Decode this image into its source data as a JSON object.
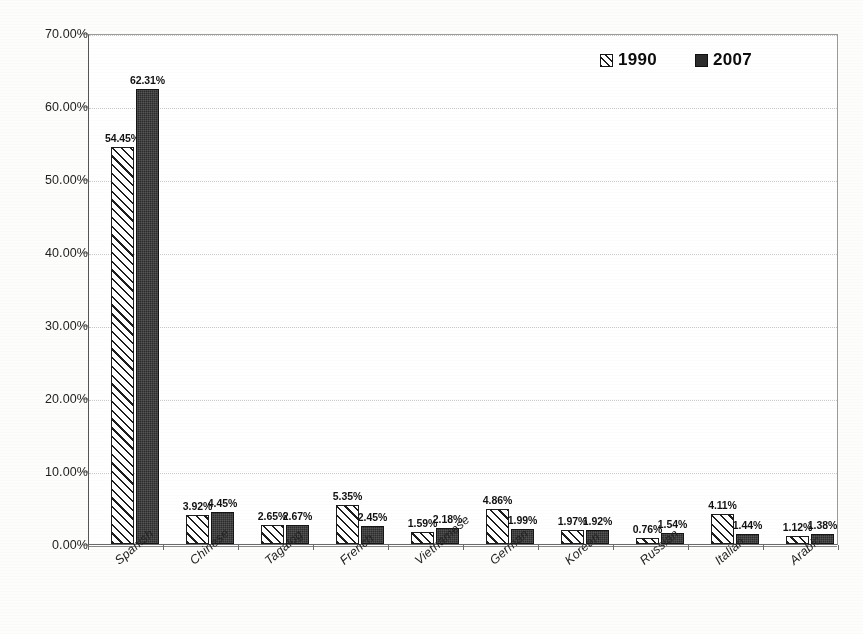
{
  "chart_data": {
    "type": "bar",
    "title": "",
    "subtitle": "",
    "xlabel": "",
    "ylabel": "",
    "ylim": [
      0,
      70
    ],
    "ytick_step": 10,
    "ytick_labels": [
      "0.00%",
      "10.00%",
      "20.00%",
      "30.00%",
      "40.00%",
      "50.00%",
      "60.00%",
      "70.00%"
    ],
    "ytick_values": [
      0,
      10,
      20,
      30,
      40,
      50,
      60,
      70
    ],
    "grid": true,
    "grid_axis": "y",
    "legend_position": "top-right",
    "value_suffix": "%",
    "categories": [
      "Spanish",
      "Chinese",
      "Tagalog",
      "French",
      "Vietnamese",
      "German",
      "Korean",
      "Russian",
      "Italian",
      "Arabic"
    ],
    "series": [
      {
        "name": "1990",
        "values": [
          54.45,
          3.92,
          2.65,
          5.35,
          1.59,
          4.86,
          1.97,
          0.76,
          4.11,
          1.12
        ],
        "labels": [
          "54.45%",
          "3.92%",
          "2.65%",
          "5.35%",
          "1.59%",
          "4.86%",
          "1.97%",
          "0.76%",
          "4.11%",
          "1.12%"
        ],
        "fill": "hatch-diagonal",
        "color": "#ffffff",
        "edge_color": "#1d1d1d"
      },
      {
        "name": "2007",
        "values": [
          62.31,
          4.45,
          2.67,
          2.45,
          2.18,
          1.99,
          1.92,
          1.54,
          1.44,
          1.38
        ],
        "labels": [
          "62.31%",
          "4.45%",
          "2.67%",
          "2.45%",
          "2.18%",
          "1.99%",
          "1.92%",
          "1.54%",
          "1.44%",
          "1.38%"
        ],
        "fill": "solid",
        "color": "#2c2c2c",
        "edge_color": "#151515"
      }
    ]
  },
  "legend": {
    "items": [
      {
        "label": "1990",
        "swatch": "hatched-square-icon"
      },
      {
        "label": "2007",
        "swatch": "filled-square-icon"
      }
    ]
  }
}
